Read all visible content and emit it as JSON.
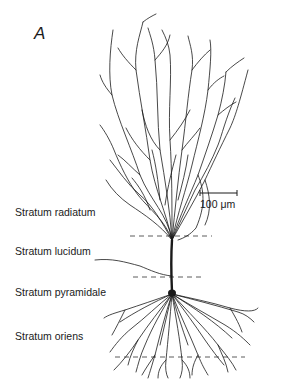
{
  "figure": {
    "panel_letter": "A",
    "scale_bar": {
      "label": "100 μm"
    },
    "layers": [
      {
        "label": "Stratum radiatum"
      },
      {
        "label": "Stratum lucidum"
      },
      {
        "label": "Stratum pyramidale"
      },
      {
        "label": "Stratum oriens"
      }
    ],
    "colors": {
      "ink": "#1a1a1a",
      "background": "#ffffff"
    }
  }
}
